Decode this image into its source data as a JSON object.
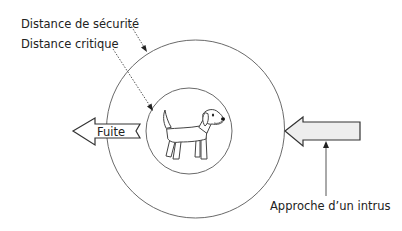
{
  "diagram": {
    "labels": {
      "safety_distance": "Distance de sécurité",
      "critical_distance": "Distance critique",
      "flight": "Fuite",
      "intruder_approach": "Approche d’un intrus"
    },
    "zones": [
      {
        "id": "safety-zone",
        "label_ref": "safety_distance"
      },
      {
        "id": "critical-zone",
        "label_ref": "critical_distance"
      }
    ],
    "subject": {
      "name": "dog",
      "icon": "dog-icon"
    },
    "arrows": [
      {
        "id": "flight-arrow",
        "direction": "left",
        "label_ref": "flight",
        "fill": "#ffffff"
      },
      {
        "id": "intruder-arrow",
        "direction": "left",
        "label_ref": "intruder_approach",
        "fill": "#eeeeee"
      }
    ],
    "colors": {
      "text": "#222222",
      "stroke": "#6a6a6a",
      "intruder_fill": "#eeeeee"
    }
  }
}
